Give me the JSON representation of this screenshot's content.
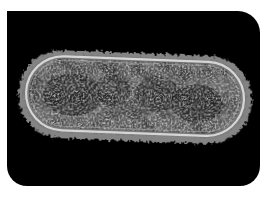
{
  "image": {
    "alt": "Micrograph of a rod-shaped bacterium on a black background",
    "subject": "rod-shaped bacterial cell (bacillus)",
    "background_color": "#000000",
    "page_background_color": "#ffffff",
    "cell_colors": {
      "halo": "#9a9a9a",
      "membrane": "#d8d8d8",
      "cytoplasm_light": "#bdbdbd",
      "cytoplasm_dark": "#2a2a2a"
    }
  }
}
